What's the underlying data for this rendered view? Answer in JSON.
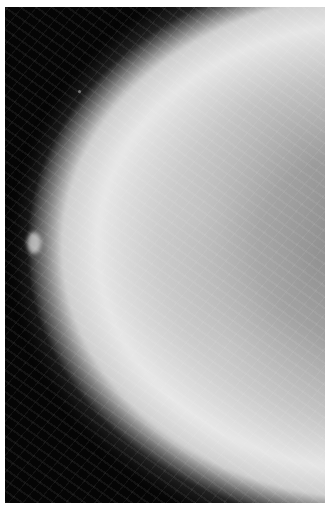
{
  "image": {
    "subject": "mammogram",
    "description": "Grayscale craniocaudal mammography X-ray of a breast on a black background with a thin white border",
    "colors": {
      "border": "#ffffff",
      "background": "#050505",
      "tissue_light": "#e6e6e6",
      "tissue_mid": "#9c9c9c"
    }
  }
}
